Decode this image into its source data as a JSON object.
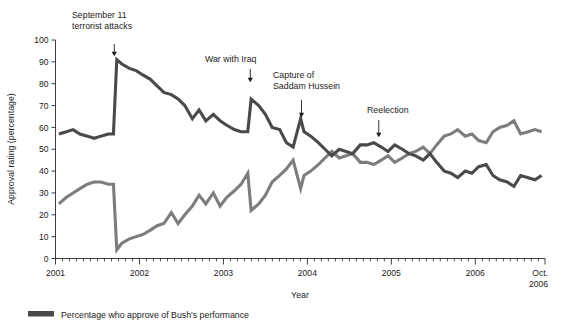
{
  "chart_data": {
    "type": "line",
    "title": "",
    "subtitle": "",
    "xlabel": "Year",
    "ylabel": "Approval rating (percentage)",
    "xlim": [
      2001.0,
      2006.83
    ],
    "ylim": [
      0,
      100
    ],
    "grid": false,
    "legend_position": "bottom-left",
    "x_tick_labels": [
      "2001",
      "2002",
      "2003",
      "2004",
      "2005",
      "2006",
      "Oct. 2006"
    ],
    "x_tick_values": [
      2001,
      2002,
      2003,
      2004,
      2005,
      2006,
      2006.83
    ],
    "x_minor_tick_interval_months": 1,
    "y_tick_labels": [
      "0",
      "10",
      "20",
      "30",
      "40",
      "50",
      "60",
      "70",
      "80",
      "90",
      "100"
    ],
    "y_tick_values": [
      0,
      10,
      20,
      30,
      40,
      50,
      60,
      70,
      80,
      90,
      100
    ],
    "series": [
      {
        "name": "Percentage who approve of Bush's performance",
        "color": "#4a4a4a",
        "x": [
          2001.04,
          2001.13,
          2001.21,
          2001.29,
          2001.38,
          2001.46,
          2001.54,
          2001.63,
          2001.69,
          2001.73,
          2001.79,
          2001.88,
          2001.96,
          2002.04,
          2002.13,
          2002.21,
          2002.29,
          2002.38,
          2002.46,
          2002.54,
          2002.63,
          2002.71,
          2002.79,
          2002.88,
          2002.96,
          2003.04,
          2003.13,
          2003.21,
          2003.29,
          2003.33,
          2003.42,
          2003.5,
          2003.58,
          2003.67,
          2003.75,
          2003.83,
          2003.92,
          2003.96,
          2004.04,
          2004.13,
          2004.21,
          2004.29,
          2004.38,
          2004.46,
          2004.54,
          2004.63,
          2004.71,
          2004.79,
          2004.88,
          2004.96,
          2005.04,
          2005.13,
          2005.21,
          2005.29,
          2005.38,
          2005.46,
          2005.54,
          2005.63,
          2005.71,
          2005.79,
          2005.88,
          2005.96,
          2006.04,
          2006.13,
          2006.21,
          2006.29,
          2006.38,
          2006.46,
          2006.54,
          2006.63,
          2006.71,
          2006.79
        ],
        "y": [
          57,
          58,
          59,
          57,
          56,
          55,
          56,
          57,
          57,
          91,
          89,
          87,
          86,
          84,
          82,
          79,
          76,
          75,
          73,
          70,
          64,
          68,
          63,
          66,
          63,
          61,
          59,
          58,
          58,
          73,
          70,
          66,
          60,
          59,
          53,
          51,
          64,
          58,
          56,
          53,
          50,
          47,
          50,
          49,
          48,
          52,
          52,
          53,
          51,
          49,
          52,
          50,
          48,
          47,
          45,
          48,
          44,
          40,
          39,
          37,
          40,
          39,
          42,
          43,
          38,
          36,
          35,
          33,
          38,
          37,
          36,
          38
        ],
        "label_visible_in_legend": true
      },
      {
        "name": "Percentage who disapprove of Bush's performance",
        "color": "#7d7d7d",
        "x": [
          2001.04,
          2001.13,
          2001.21,
          2001.29,
          2001.38,
          2001.46,
          2001.54,
          2001.63,
          2001.69,
          2001.73,
          2001.79,
          2001.88,
          2001.96,
          2002.04,
          2002.13,
          2002.21,
          2002.29,
          2002.38,
          2002.46,
          2002.54,
          2002.63,
          2002.71,
          2002.79,
          2002.88,
          2002.96,
          2003.04,
          2003.13,
          2003.21,
          2003.29,
          2003.33,
          2003.42,
          2003.5,
          2003.58,
          2003.67,
          2003.75,
          2003.83,
          2003.92,
          2003.96,
          2004.04,
          2004.13,
          2004.21,
          2004.29,
          2004.38,
          2004.46,
          2004.54,
          2004.63,
          2004.71,
          2004.79,
          2004.88,
          2004.96,
          2005.04,
          2005.13,
          2005.21,
          2005.29,
          2005.38,
          2005.46,
          2005.54,
          2005.63,
          2005.71,
          2005.79,
          2005.88,
          2005.96,
          2006.04,
          2006.13,
          2006.21,
          2006.29,
          2006.38,
          2006.46,
          2006.54,
          2006.63,
          2006.71,
          2006.79
        ],
        "y": [
          25,
          28,
          30,
          32,
          34,
          35,
          35,
          34,
          34,
          4,
          7,
          9,
          10,
          11,
          13,
          15,
          16,
          21,
          16,
          20,
          24,
          29,
          25,
          30,
          24,
          28,
          31,
          34,
          39,
          22,
          25,
          29,
          35,
          38,
          41,
          45,
          32,
          38,
          40,
          43,
          46,
          49,
          46,
          47,
          48,
          44,
          44,
          43,
          45,
          47,
          44,
          46,
          48,
          49,
          51,
          48,
          52,
          56,
          57,
          59,
          56,
          57,
          54,
          53,
          58,
          60,
          61,
          63,
          57,
          58,
          59,
          58
        ],
        "label_visible_in_legend": false
      }
    ],
    "annotations": [
      {
        "id": "sept11",
        "text_lines": [
          "September 11",
          "terrorist attacks"
        ],
        "x": 2001.7,
        "points_to_y": 93
      },
      {
        "id": "war-iraq",
        "text_lines": [
          "War with Iraq"
        ],
        "x": 2003.32,
        "points_to_y": 76
      },
      {
        "id": "capture-saddam",
        "text_lines": [
          "Capture of",
          "Saddam Hussein"
        ],
        "x": 2003.93,
        "points_to_y": 68
      },
      {
        "id": "reelection",
        "text_lines": [
          "Reelection"
        ],
        "x": 2004.85,
        "points_to_y": 58
      }
    ]
  },
  "legend": {
    "entries": [
      {
        "label": "Percentage who approve of Bush's performance",
        "color": "#4a4a4a"
      }
    ]
  },
  "axis": {
    "y_title": "Approval rating (percentage)",
    "x_title": "Year"
  },
  "colors": {
    "approve_line": "#4a4a4a",
    "disapprove_line": "#7d7d7d",
    "axis": "#2a2a2a",
    "text": "#1b1b1b",
    "background": "#ffffff"
  }
}
